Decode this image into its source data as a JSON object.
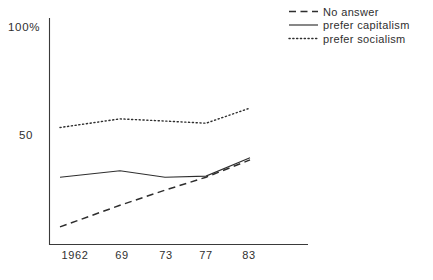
{
  "chart_data": {
    "type": "line",
    "title": "",
    "subtitle": "",
    "xlabel": "",
    "ylabel": "",
    "x": [
      1962,
      1969,
      1973,
      1977,
      1983
    ],
    "categories": [
      "1962",
      "69",
      "73",
      "77",
      "83"
    ],
    "xtick_labels": [
      "1962",
      "69",
      "73",
      "77",
      "83"
    ],
    "ytick_labels": [
      "100%",
      "50"
    ],
    "ytick_values": [
      100,
      50
    ],
    "ylim": [
      0,
      104
    ],
    "xlim": [
      1960.5,
      1986.5
    ],
    "grid": false,
    "legend_position": "top-right",
    "series": [
      {
        "name": "No answer",
        "style": "dashed",
        "color": "#2e2e2e",
        "values": [
          7,
          17,
          24,
          30,
          38
        ]
      },
      {
        "name": "prefer capitalism",
        "style": "solid",
        "color": "#2e2e2e",
        "values": [
          30,
          33,
          30,
          30.5,
          39
        ]
      },
      {
        "name": "prefer socialism",
        "style": "dotted",
        "color": "#2e2e2e",
        "values": [
          53,
          57,
          56,
          55,
          62
        ]
      }
    ]
  },
  "axes": {
    "y_top_label": "100%",
    "y_mid_label": "50"
  },
  "xaxis": {
    "ticks": [
      {
        "label": "1962"
      },
      {
        "label": "69"
      },
      {
        "label": "73"
      },
      {
        "label": "77"
      },
      {
        "label": "83"
      }
    ]
  },
  "legend": {
    "items": [
      {
        "label": "No answer",
        "style": "dashed"
      },
      {
        "label": "prefer capitalism",
        "style": "solid"
      },
      {
        "label": "prefer socialism",
        "style": "dotted"
      }
    ]
  }
}
